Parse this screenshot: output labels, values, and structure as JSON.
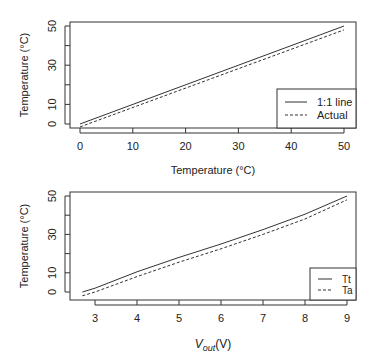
{
  "chart_data": [
    {
      "type": "line",
      "title": "",
      "xlabel": "Temperature (°C)",
      "ylabel": "Temperature (°C)",
      "xlim": [
        0,
        50
      ],
      "ylim": [
        0,
        50
      ],
      "xticks": [
        "0",
        "10",
        "20",
        "30",
        "40",
        "50"
      ],
      "yticks": [
        "0",
        "10",
        "30",
        "50"
      ],
      "grid": false,
      "legend_position": "bottom-right",
      "series": [
        {
          "name": "1:1 line",
          "style": "solid",
          "x": [
            0,
            50
          ],
          "y": [
            0,
            50
          ]
        },
        {
          "name": "Actual",
          "style": "dashed",
          "x": [
            0,
            50
          ],
          "y": [
            -1.5,
            48
          ]
        }
      ]
    },
    {
      "type": "line",
      "title": "",
      "xlabel": "V_out(V)",
      "ylabel": "Temperature (°C)",
      "xlim": [
        2.7,
        9
      ],
      "ylim": [
        0,
        50
      ],
      "xticks": [
        "3",
        "4",
        "5",
        "6",
        "7",
        "8",
        "9"
      ],
      "yticks": [
        "0",
        "10",
        "30",
        "50"
      ],
      "grid": false,
      "legend_position": "bottom-right",
      "series": [
        {
          "name": "Tt",
          "style": "solid",
          "x": [
            2.7,
            3,
            4,
            5,
            6,
            7,
            8,
            9
          ],
          "y": [
            0,
            2,
            10.5,
            18,
            25,
            32.5,
            40.5,
            50
          ]
        },
        {
          "name": "Ta",
          "style": "dashed",
          "x": [
            2.7,
            3,
            4,
            5,
            6,
            7,
            8,
            9
          ],
          "y": [
            -2,
            0,
            8,
            15.5,
            22.5,
            30,
            38,
            48
          ]
        }
      ]
    }
  ],
  "top": {
    "ylabel": "Temperature (°C)",
    "xlabel": "Temperature (°C)",
    "legend": [
      "1:1 line",
      "Actual"
    ]
  },
  "bottom": {
    "ylabel": "Temperature (°C)",
    "xlabel_main": "V",
    "xlabel_sub": "out",
    "xlabel_unit": "(V)",
    "legend": [
      "Tt",
      "Ta"
    ]
  }
}
